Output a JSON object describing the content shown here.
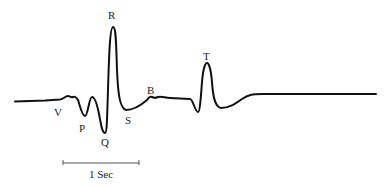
{
  "diagram": {
    "type": "waveform",
    "stroke_color": "#111111",
    "labels": {
      "V": "V",
      "P": "P",
      "Q": "Q",
      "R": "R",
      "S": "S",
      "B": "B",
      "T": "T"
    },
    "scale_bar": {
      "label": "1 Sec"
    }
  }
}
